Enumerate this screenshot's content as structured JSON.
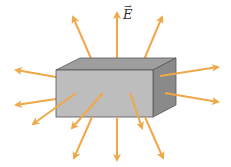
{
  "diagram": {
    "field_label": "E",
    "field_label_vector": true,
    "colors": {
      "arrow": "#f0a848",
      "box_front": "#bdbdbd",
      "box_top": "#9e9e9e",
      "box_side": "#8a8a8a",
      "box_edge": "#555555",
      "background": "#ffffff"
    },
    "arrow_count": 14
  }
}
